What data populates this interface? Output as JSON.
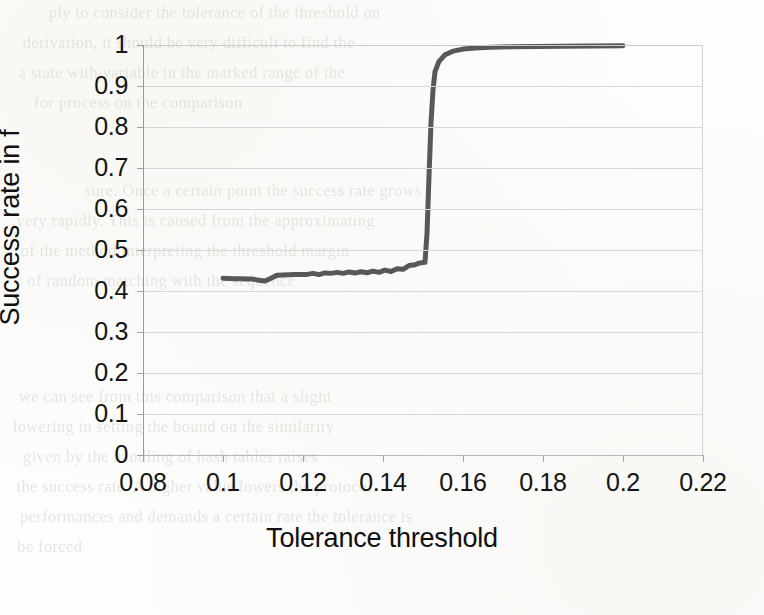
{
  "chart_data": {
    "type": "line",
    "title": "",
    "xlabel": "Tolerance threshold",
    "ylabel": "Success rate in f",
    "xlim": [
      0.08,
      0.22
    ],
    "ylim": [
      0,
      1
    ],
    "grid": true,
    "legend": false,
    "xticks": [
      "0.08",
      "0.1",
      "0.12",
      "0.14",
      "0.16",
      "0.18",
      "0.2",
      "0.22"
    ],
    "xtick_values": [
      0.08,
      0.1,
      0.12,
      0.14,
      0.16,
      0.18,
      0.2,
      0.22
    ],
    "yticks": [
      "0",
      "0.1",
      "0.2",
      "0.3",
      "0.4",
      "0.5",
      "0.6",
      "0.7",
      "0.8",
      "0.9",
      "1"
    ],
    "ytick_values": [
      0,
      0.1,
      0.2,
      0.3,
      0.4,
      0.5,
      0.6,
      0.7,
      0.8,
      0.9,
      1.0
    ],
    "series": [
      {
        "name": "Success rate in f",
        "color": "#585858",
        "line_width": 5,
        "x": [
          0.1,
          0.1015,
          0.103,
          0.1045,
          0.106,
          0.1075,
          0.109,
          0.1105,
          0.112,
          0.1135,
          0.115,
          0.1165,
          0.118,
          0.1195,
          0.121,
          0.1225,
          0.124,
          0.1255,
          0.127,
          0.1285,
          0.13,
          0.1315,
          0.133,
          0.1345,
          0.136,
          0.1375,
          0.139,
          0.1405,
          0.142,
          0.1435,
          0.145,
          0.1465,
          0.148,
          0.149,
          0.15,
          0.1505,
          0.151,
          0.1515,
          0.152,
          0.1525,
          0.153,
          0.154,
          0.1555,
          0.1575,
          0.16,
          0.163,
          0.167,
          0.172,
          0.178,
          0.185,
          0.192,
          0.2
        ],
        "y": [
          0.431,
          0.4305,
          0.43,
          0.43,
          0.4295,
          0.429,
          0.426,
          0.4245,
          0.431,
          0.4385,
          0.439,
          0.4395,
          0.44,
          0.44,
          0.4405,
          0.443,
          0.44,
          0.444,
          0.443,
          0.4455,
          0.443,
          0.4465,
          0.444,
          0.447,
          0.4445,
          0.4485,
          0.4455,
          0.451,
          0.4475,
          0.4545,
          0.453,
          0.462,
          0.464,
          0.468,
          0.4695,
          0.47,
          0.54,
          0.68,
          0.81,
          0.89,
          0.935,
          0.96,
          0.976,
          0.985,
          0.99,
          0.9925,
          0.9945,
          0.9955,
          0.9965,
          0.997,
          0.9975,
          0.998
        ]
      }
    ],
    "annotations": {
      "plateau_start_value": 0.47,
      "plateau_start_x": 0.1505,
      "transition_x": 0.1515,
      "baseline_start_value": 0.431,
      "final_value": 0.998
    }
  },
  "scan_artifacts": {
    "ghost_lines": [
      {
        "text": "ply to consider the tolerance of the threshold on",
        "x": 52,
        "y": 4,
        "size": 16
      },
      {
        "text": "derivation, it should be very difficult to find the",
        "x": 26,
        "y": 34,
        "size": 16
      },
      {
        "text": "a state with variable in the marked range of the",
        "x": 22,
        "y": 64,
        "size": 16
      },
      {
        "text": "for process on the comparison",
        "x": 36,
        "y": 94,
        "size": 16
      },
      {
        "text": "sure. Once a certain point the success rate grows",
        "x": 88,
        "y": 182,
        "size": 16
      },
      {
        "text": "very rapidly. This is caused from the approximating",
        "x": 20,
        "y": 212,
        "size": 16
      },
      {
        "text": "of the method interpreting the threshold margin",
        "x": 24,
        "y": 242,
        "size": 16
      },
      {
        "text": "of random matching with the sequence",
        "x": 30,
        "y": 272,
        "size": 16
      },
      {
        "text": "we can see from this comparison that a slight",
        "x": 22,
        "y": 388,
        "size": 16
      },
      {
        "text": "lowering in setting the bound on the similarity",
        "x": 16,
        "y": 418,
        "size": 16
      },
      {
        "text": "given by the handling of hash tables raises",
        "x": 26,
        "y": 448,
        "size": 16
      },
      {
        "text": "the success rate. A higher value lowers the protocol",
        "x": 20,
        "y": 478,
        "size": 16
      },
      {
        "text": "performances and demands a certain rate the tolerance is",
        "x": 24,
        "y": 508,
        "size": 16
      },
      {
        "text": "be forced",
        "x": 18,
        "y": 538,
        "size": 16
      }
    ]
  }
}
